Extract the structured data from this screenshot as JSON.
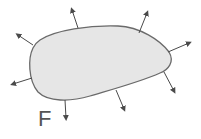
{
  "diagram": {
    "label": "F",
    "colors": {
      "fill": "#e6e6e6",
      "stroke": "#6a6a6a",
      "arrow": "#4a4a4a",
      "text": "#555555"
    },
    "arrow_count": 8
  }
}
